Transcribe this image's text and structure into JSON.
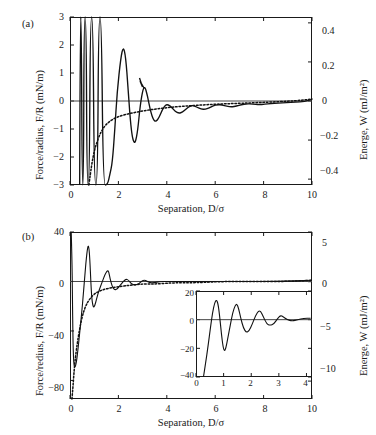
{
  "figure": {
    "panels": [
      {
        "letter": "(a)",
        "xlabel": "Separation, D/σ",
        "ylabel_left": "Force/radius, F/R (mN/m)",
        "ylabel_right": "Energe, W (mJ/m²)",
        "xticks": [
          "0",
          "2",
          "4",
          "6",
          "8",
          "10"
        ],
        "yticks_left": [
          "3",
          "2",
          "1",
          "0",
          "−1",
          "−2",
          "−3"
        ],
        "yticks_right": [
          "0.4",
          "0.2",
          "0",
          "−0.2",
          "−0.4"
        ],
        "labels": {
          "repulsion": "Repulsion",
          "attraction": "Attraction",
          "annotation": "Continuum van der Waals force"
        }
      },
      {
        "letter": "(b)",
        "xlabel": "Separation, D/σ",
        "ylabel_left": "Force/redius, F/R (mN/m)",
        "ylabel_right": "Energe, W (mJ/m²)",
        "xticks": [
          "0",
          "2",
          "4",
          "6",
          "8",
          "10"
        ],
        "yticks_left": [
          "40",
          "0",
          "−40",
          "−80"
        ],
        "yticks_right": [
          "5",
          "0",
          "−5",
          "−10"
        ],
        "labels": {
          "repulsion": "Repulsion",
          "attraction": "Attraction"
        },
        "inset": {
          "xticks": [
            "0",
            "1",
            "2",
            "3",
            "4"
          ],
          "yticks": [
            "20",
            "0",
            "−20",
            "−40"
          ]
        }
      }
    ]
  },
  "chart_data": [
    {
      "type": "line",
      "title": "(a) Oscillatory solvation force between mica surfaces in OMCTS",
      "xlabel": "Separation, D/σ",
      "ylabel": "Force/radius, F/R (mN/m)",
      "ylabel_secondary": "Energe, W (mJ/m²)",
      "xlim": [
        0,
        10
      ],
      "ylim": [
        -3,
        3
      ],
      "ylim_secondary": [
        -0.43,
        0.43
      ],
      "xticks": [
        0,
        2,
        4,
        6,
        8,
        10
      ],
      "yticks": [
        3,
        2,
        1,
        0,
        -1,
        -2,
        -3
      ],
      "yticks_secondary": [
        0.4,
        0.2,
        0,
        -0.2,
        -0.4
      ],
      "grid": false,
      "legend": false,
      "annotations": [
        {
          "text": "Repulsion",
          "x": 6.0,
          "y": 1.55
        },
        {
          "text": "Attraction",
          "x": 6.2,
          "y": -1.0
        },
        {
          "text": "Continuum van der Waals force",
          "x": 4.9,
          "y": -1.62
        }
      ],
      "series": [
        {
          "name": "Oscillatory solvation force",
          "style": "solid",
          "comment": "damped oscillation, period ~0.9 sigma; off-scale spikes below D/sigma = 1.5",
          "points": [
            [
              0.4,
              -3.0
            ],
            [
              0.42,
              3.0
            ],
            [
              0.47,
              3.0
            ],
            [
              0.5,
              -3.0
            ],
            [
              0.56,
              -3.0
            ],
            [
              0.58,
              3.0
            ],
            [
              0.67,
              3.0
            ],
            [
              0.7,
              -3.0
            ],
            [
              0.8,
              -3.0
            ],
            [
              0.84,
              3.0
            ],
            [
              0.95,
              3.0
            ],
            [
              1.0,
              -3.0
            ],
            [
              1.14,
              -3.0
            ],
            [
              1.18,
              3.0
            ],
            [
              1.3,
              3.0
            ],
            [
              1.37,
              -3.0
            ],
            [
              1.55,
              -3.0
            ],
            [
              1.65,
              -2.62
            ],
            [
              1.75,
              -2.2
            ],
            [
              1.85,
              -1.05
            ],
            [
              1.95,
              0.35
            ],
            [
              2.1,
              1.55
            ],
            [
              2.2,
              1.95
            ],
            [
              2.3,
              1.6
            ],
            [
              2.4,
              0.45
            ],
            [
              2.48,
              -0.55
            ],
            [
              2.55,
              -1.15
            ],
            [
              2.62,
              -1.45
            ],
            [
              2.7,
              -1.5
            ],
            [
              2.8,
              -1.05
            ],
            [
              2.9,
              -0.15
            ],
            [
              3.02,
              0.45
            ],
            [
              3.1,
              0.5
            ],
            [
              3.2,
              0.2
            ],
            [
              3.32,
              -0.35
            ],
            [
              3.45,
              -0.68
            ],
            [
              3.55,
              -0.74
            ],
            [
              3.68,
              -0.6
            ],
            [
              3.82,
              -0.3
            ],
            [
              3.95,
              -0.14
            ],
            [
              4.05,
              -0.13
            ],
            [
              4.2,
              -0.22
            ],
            [
              4.35,
              -0.38
            ],
            [
              4.5,
              -0.44
            ],
            [
              4.65,
              -0.4
            ],
            [
              4.8,
              -0.28
            ],
            [
              4.95,
              -0.18
            ],
            [
              5.1,
              -0.16
            ],
            [
              5.25,
              -0.22
            ],
            [
              5.42,
              -0.29
            ],
            [
              5.58,
              -0.3
            ],
            [
              5.75,
              -0.25
            ],
            [
              5.92,
              -0.17
            ],
            [
              6.1,
              -0.13
            ],
            [
              6.28,
              -0.14
            ],
            [
              6.48,
              -0.19
            ],
            [
              6.68,
              -0.21
            ],
            [
              6.88,
              -0.18
            ],
            [
              7.08,
              -0.13
            ],
            [
              7.3,
              -0.1
            ],
            [
              7.55,
              -0.11
            ],
            [
              7.8,
              -0.13
            ],
            [
              8.05,
              -0.12
            ],
            [
              8.3,
              -0.09
            ],
            [
              8.6,
              -0.07
            ],
            [
              8.95,
              -0.06
            ],
            [
              9.3,
              -0.04
            ],
            [
              9.7,
              -0.02
            ],
            [
              10.0,
              0.06
            ]
          ]
        },
        {
          "name": "Continuum van der Waals force",
          "style": "dotted",
          "points": [
            [
              0.78,
              -3.0
            ],
            [
              0.85,
              -2.55
            ],
            [
              0.92,
              -2.15
            ],
            [
              1.0,
              -1.8
            ],
            [
              1.1,
              -1.5
            ],
            [
              1.22,
              -1.22
            ],
            [
              1.35,
              -1.0
            ],
            [
              1.5,
              -0.83
            ],
            [
              1.68,
              -0.7
            ],
            [
              1.88,
              -0.6
            ],
            [
              2.1,
              -0.53
            ],
            [
              2.35,
              -0.47
            ],
            [
              2.62,
              -0.42
            ],
            [
              2.92,
              -0.37
            ],
            [
              3.25,
              -0.32
            ],
            [
              3.6,
              -0.28
            ],
            [
              4.0,
              -0.24
            ],
            [
              4.45,
              -0.2
            ],
            [
              4.95,
              -0.17
            ],
            [
              5.5,
              -0.14
            ],
            [
              6.1,
              -0.11
            ],
            [
              6.75,
              -0.09
            ],
            [
              7.45,
              -0.07
            ],
            [
              8.2,
              -0.04
            ],
            [
              9.0,
              -0.01
            ],
            [
              9.6,
              0.03
            ],
            [
              10.0,
              0.07
            ]
          ]
        }
      ]
    },
    {
      "type": "line",
      "title": "(b) Oscillatory solvation force, larger force scale",
      "xlabel": "Separation, D/σ",
      "ylabel": "Force/redius, F/R (mN/m)",
      "ylabel_secondary": "Energe, W (mJ/m²)",
      "xlim": [
        0,
        10
      ],
      "ylim": [
        -95,
        40
      ],
      "ylim_secondary": [
        -11.8,
        5.0
      ],
      "xticks": [
        0,
        2,
        4,
        6,
        8,
        10
      ],
      "yticks": [
        40,
        0,
        -40,
        -80
      ],
      "yticks_secondary": [
        5,
        0,
        -5,
        -10
      ],
      "grid": false,
      "legend": false,
      "annotations": [
        {
          "text": "Repulsion",
          "x": 4.6,
          "y": 26
        },
        {
          "text": "Attraction",
          "x": 3.1,
          "y": -42
        }
      ],
      "series": [
        {
          "name": "Oscillatory solvation force",
          "style": "solid",
          "points": [
            [
              0.05,
              40
            ],
            [
              0.08,
              20
            ],
            [
              0.1,
              -10
            ],
            [
              0.12,
              -45
            ],
            [
              0.15,
              -66
            ],
            [
              0.2,
              -70
            ],
            [
              0.26,
              -66
            ],
            [
              0.33,
              -55
            ],
            [
              0.42,
              -38
            ],
            [
              0.52,
              -18
            ],
            [
              0.6,
              2
            ],
            [
              0.68,
              20
            ],
            [
              0.74,
              29
            ],
            [
              0.78,
              28
            ],
            [
              0.82,
              18
            ],
            [
              0.86,
              0
            ],
            [
              0.9,
              -14
            ],
            [
              0.96,
              -21
            ],
            [
              1.02,
              -20
            ],
            [
              1.1,
              -14
            ],
            [
              1.2,
              -7
            ],
            [
              1.32,
              -1
            ],
            [
              1.45,
              6
            ],
            [
              1.55,
              9
            ],
            [
              1.6,
              8
            ],
            [
              1.66,
              2
            ],
            [
              1.74,
              -4
            ],
            [
              1.84,
              -7
            ],
            [
              1.95,
              -6
            ],
            [
              2.08,
              -3
            ],
            [
              2.2,
              0
            ],
            [
              2.32,
              2
            ],
            [
              2.42,
              1
            ],
            [
              2.54,
              -2
            ],
            [
              2.68,
              -3
            ],
            [
              2.84,
              -2
            ],
            [
              3.0,
              1
            ],
            [
              3.12,
              1
            ],
            [
              3.28,
              -1
            ],
            [
              3.48,
              -1
            ],
            [
              3.7,
              0
            ],
            [
              4.0,
              0
            ],
            [
              4.5,
              0
            ],
            [
              5.5,
              0
            ],
            [
              7.0,
              0
            ],
            [
              8.5,
              0
            ],
            [
              10.0,
              1
            ]
          ]
        },
        {
          "name": "Continuum van der Waals force",
          "style": "dotted",
          "points": [
            [
              0.08,
              -95
            ],
            [
              0.12,
              -86
            ],
            [
              0.17,
              -72
            ],
            [
              0.22,
              -62
            ],
            [
              0.3,
              -50
            ],
            [
              0.4,
              -38
            ],
            [
              0.52,
              -27
            ],
            [
              0.66,
              -19
            ],
            [
              0.82,
              -14
            ],
            [
              1.0,
              -10
            ],
            [
              1.2,
              -8
            ],
            [
              1.45,
              -6
            ],
            [
              1.75,
              -5
            ],
            [
              2.1,
              -4
            ],
            [
              2.5,
              -3
            ],
            [
              3.0,
              -2
            ],
            [
              3.6,
              -2
            ],
            [
              4.3,
              -1
            ],
            [
              5.2,
              -1
            ],
            [
              6.3,
              0
            ],
            [
              7.6,
              0
            ],
            [
              9.0,
              0
            ],
            [
              10.0,
              1
            ]
          ]
        }
      ],
      "inset": {
        "type": "line",
        "xlim": [
          0,
          4.2
        ],
        "ylim": [
          -40,
          20
        ],
        "xticks": [
          0,
          1,
          2,
          3,
          4
        ],
        "yticks": [
          20,
          0,
          -20,
          -40
        ],
        "grid": false,
        "series": [
          {
            "name": "Oscillatory solvation force (magnified)",
            "style": "solid",
            "points": [
              [
                0.27,
                -40
              ],
              [
                0.35,
                -30
              ],
              [
                0.44,
                -18
              ],
              [
                0.52,
                -6
              ],
              [
                0.6,
                5
              ],
              [
                0.68,
                12
              ],
              [
                0.74,
                14
              ],
              [
                0.8,
                11
              ],
              [
                0.86,
                2
              ],
              [
                0.92,
                -10
              ],
              [
                0.98,
                -19
              ],
              [
                1.03,
                -22
              ],
              [
                1.08,
                -20
              ],
              [
                1.15,
                -13
              ],
              [
                1.24,
                -4
              ],
              [
                1.33,
                5
              ],
              [
                1.42,
                10
              ],
              [
                1.48,
                11
              ],
              [
                1.54,
                8
              ],
              [
                1.62,
                1
              ],
              [
                1.72,
                -6
              ],
              [
                1.82,
                -9
              ],
              [
                1.92,
                -8
              ],
              [
                2.04,
                -3
              ],
              [
                2.16,
                3
              ],
              [
                2.26,
                6
              ],
              [
                2.34,
                6
              ],
              [
                2.44,
                2
              ],
              [
                2.56,
                -3
              ],
              [
                2.68,
                -4
              ],
              [
                2.82,
                -3
              ],
              [
                2.96,
                1
              ],
              [
                3.06,
                3
              ],
              [
                3.16,
                2
              ],
              [
                3.3,
                0
              ],
              [
                3.48,
                -1
              ],
              [
                3.68,
                0
              ],
              [
                3.9,
                1
              ],
              [
                4.15,
                1
              ]
            ]
          }
        ]
      }
    }
  ]
}
